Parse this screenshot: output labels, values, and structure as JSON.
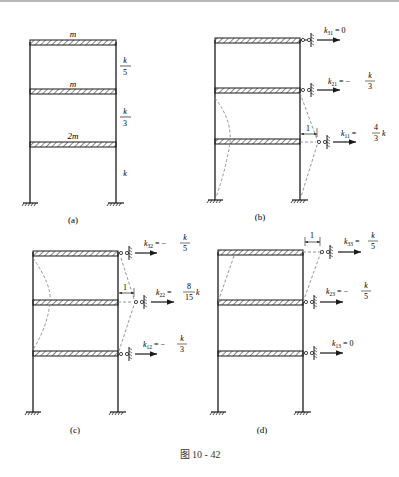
{
  "figure": {
    "caption": "图 10 - 42",
    "colors": {
      "line": "#1a1a1a",
      "dashed": "#8a8a8a",
      "hatch": "#555555"
    }
  },
  "panels": [
    {
      "id": "a",
      "label": "(a)",
      "masses": [
        "m",
        "m",
        "2m"
      ],
      "stiffness": [
        {
          "num": "k",
          "den": "5"
        },
        {
          "num": "k",
          "den": "3"
        },
        {
          "num": "k",
          "den": ""
        }
      ]
    },
    {
      "id": "b",
      "label": "(b)",
      "unit_disp": "1",
      "coeffs": [
        {
          "name": "k",
          "sub": "31",
          "eq": "= 0"
        },
        {
          "name": "k",
          "sub": "21",
          "eq": "= −",
          "num": "k",
          "den": "3"
        },
        {
          "name": "k",
          "sub": "11",
          "eq": "=",
          "num": "4",
          "den": "3",
          "tail": "k"
        }
      ]
    },
    {
      "id": "c",
      "label": "(c)",
      "unit_disp": "1",
      "coeffs": [
        {
          "name": "k",
          "sub": "32",
          "eq": "= −",
          "num": "k",
          "den": "5"
        },
        {
          "name": "k",
          "sub": "22",
          "eq": "=",
          "num": "8",
          "den": "15",
          "tail": "k"
        },
        {
          "name": "k",
          "sub": "12",
          "eq": "= −",
          "num": "k",
          "den": "3"
        }
      ]
    },
    {
      "id": "d",
      "label": "(d)",
      "unit_disp": "1",
      "coeffs": [
        {
          "name": "k",
          "sub": "33",
          "eq": "=",
          "num": "k",
          "den": "5"
        },
        {
          "name": "k",
          "sub": "23",
          "eq": "= −",
          "num": "k",
          "den": "5"
        },
        {
          "name": "k",
          "sub": "13",
          "eq": "= 0"
        }
      ]
    }
  ]
}
